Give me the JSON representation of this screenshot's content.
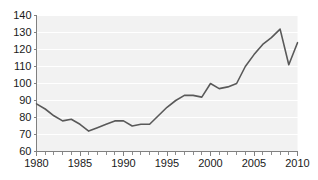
{
  "chart_data": {
    "type": "line",
    "title": "",
    "subtitle": "",
    "xlabel": "",
    "ylabel": "",
    "xlim": [
      1980,
      2010
    ],
    "ylim": [
      60,
      140
    ],
    "grid": true,
    "legend": false,
    "legend_position": "none",
    "line_color": "#595959",
    "plot_background_color": "#f2f2f2",
    "gridline_color": "#ffffff",
    "axis_color": "#808080",
    "y_ticks": [
      60,
      70,
      80,
      90,
      100,
      110,
      120,
      130,
      140
    ],
    "y_tick_labels": [
      "60",
      "70",
      "80",
      "90",
      "100",
      "110",
      "120",
      "130",
      "140"
    ],
    "x_ticks": [
      1980,
      1985,
      1990,
      1995,
      2000,
      2005,
      2010
    ],
    "x_tick_labels": [
      "1980",
      "1985",
      "1990",
      "1995",
      "2000",
      "2005",
      "2010"
    ],
    "x_minor_tick_step": 1,
    "x": [
      1980,
      1981,
      1982,
      1983,
      1984,
      1985,
      1986,
      1987,
      1988,
      1989,
      1990,
      1991,
      1992,
      1993,
      1994,
      1995,
      1996,
      1997,
      1998,
      1999,
      2000,
      2001,
      2002,
      2003,
      2004,
      2005,
      2006,
      2007,
      2008,
      2009,
      2010
    ],
    "values": [
      88,
      85,
      81,
      78,
      79,
      76,
      72,
      74,
      76,
      78,
      78,
      75,
      76,
      76,
      81,
      86,
      90,
      93,
      93,
      92,
      100,
      97,
      98,
      100,
      110,
      117,
      123,
      127,
      132,
      111,
      124
    ],
    "series": [
      {
        "name": "index",
        "color": "#595959",
        "values": [
          88,
          85,
          81,
          78,
          79,
          76,
          72,
          74,
          76,
          78,
          78,
          75,
          76,
          76,
          81,
          86,
          90,
          93,
          93,
          92,
          100,
          97,
          98,
          100,
          110,
          117,
          123,
          127,
          132,
          111,
          124
        ]
      }
    ],
    "annotations": []
  }
}
